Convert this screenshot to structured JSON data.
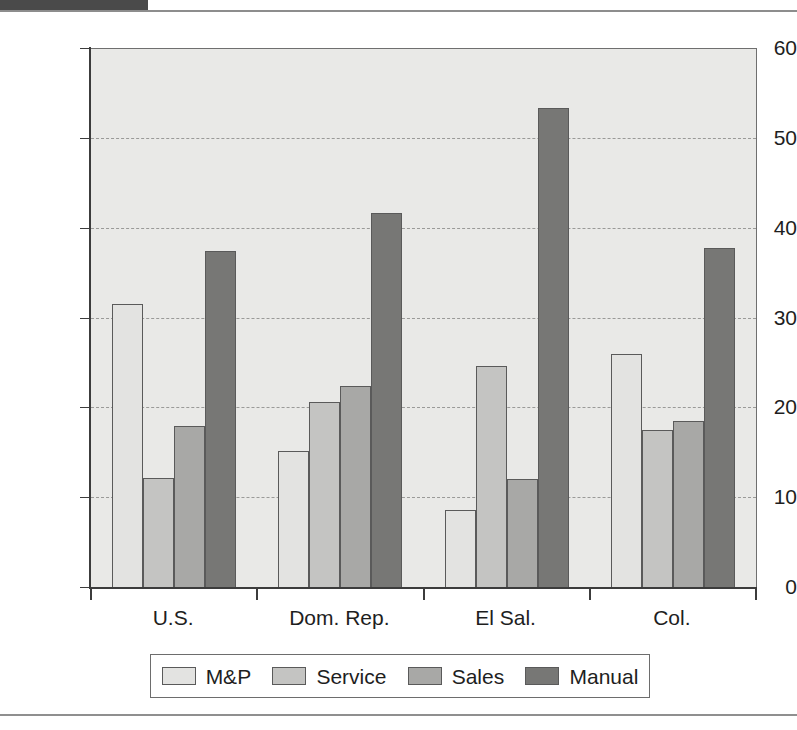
{
  "figure": {
    "background_color": "#ffffff",
    "plot_background_color": "#e9e9e7",
    "axis_color": "#3c3c3c",
    "gridline_color": "#9a9a98"
  },
  "chart_data": {
    "type": "bar",
    "title": "",
    "subtitle": "",
    "xlabel": "",
    "ylabel": "",
    "categories": [
      "U.S.",
      "Dom. Rep.",
      "El Sal.",
      "Col."
    ],
    "series": [
      {
        "name": "M&P",
        "color": "#e3e3e1",
        "values": [
          31.6,
          15.2,
          8.7,
          26.0
        ]
      },
      {
        "name": "Service",
        "color": "#c4c4c2",
        "values": [
          12.2,
          20.7,
          24.7,
          17.6
        ]
      },
      {
        "name": "Sales",
        "color": "#a8a8a6",
        "values": [
          18.0,
          22.5,
          12.1,
          18.6
        ]
      },
      {
        "name": "Manual",
        "color": "#777775",
        "values": [
          37.5,
          41.7,
          53.4,
          37.9
        ]
      }
    ],
    "ylim": [
      0,
      60
    ],
    "yticks": [
      0,
      10,
      20,
      30,
      40,
      50,
      60
    ],
    "ytick_labels": [
      "0",
      "10",
      "20",
      "30",
      "40",
      "50",
      "60"
    ],
    "grid": true,
    "grid_axis": "y",
    "grid_style": "dashed",
    "gridline_values": [
      10,
      20,
      30,
      40,
      50
    ],
    "legend": {
      "position": "bottom",
      "entries": [
        "M&P",
        "Service",
        "Sales",
        "Manual"
      ]
    },
    "annotations": []
  }
}
